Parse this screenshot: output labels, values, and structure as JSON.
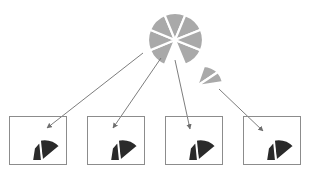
{
  "diagram": {
    "colors": {
      "source_pie": "#a9a9a9",
      "target_slice": "#2a2a2a",
      "box_stroke": "#8c8c8c",
      "arrow": "#6e6e6e",
      "background": "#ffffff"
    },
    "source_pie": {
      "slices_shown": 7,
      "slices_total": 8,
      "detached_slice": 1
    },
    "boxes": [
      {
        "id": 1,
        "label": ""
      },
      {
        "id": 2,
        "label": ""
      },
      {
        "id": 3,
        "label": ""
      },
      {
        "id": 4,
        "label": ""
      }
    ],
    "arrows_count": 4
  }
}
